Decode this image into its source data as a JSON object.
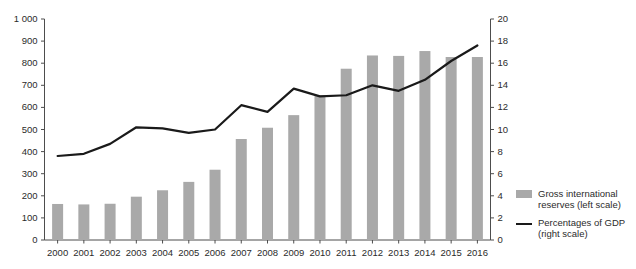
{
  "chart_data": {
    "type": "bar",
    "title": "",
    "subtitle": "",
    "xlabel": "",
    "ylabel": "",
    "grid": false,
    "legend_position": "right",
    "categories": [
      "2000",
      "2001",
      "2002",
      "2003",
      "2004",
      "2005",
      "2006",
      "2007",
      "2008",
      "2009",
      "2010",
      "2011",
      "2012",
      "2013",
      "2014",
      "2015",
      "2016"
    ],
    "axes": {
      "left": {
        "label": "",
        "min": 0,
        "max": 1000,
        "step": 100,
        "ticks": [
          "0",
          "100",
          "200",
          "300",
          "400",
          "500",
          "600",
          "700",
          "800",
          "900",
          "1 000"
        ],
        "tick_values": [
          0,
          100,
          200,
          300,
          400,
          500,
          600,
          700,
          800,
          900,
          1000
        ]
      },
      "right": {
        "label": "",
        "min": 0,
        "max": 20,
        "step": 2,
        "ticks": [
          "0",
          "2",
          "4",
          "6",
          "8",
          "10",
          "12",
          "14",
          "16",
          "18",
          "20"
        ],
        "tick_values": [
          0,
          2,
          4,
          6,
          8,
          10,
          12,
          14,
          16,
          18,
          20
        ]
      }
    },
    "series": [
      {
        "name": "Gross international reserves (left scale)",
        "type": "bar",
        "axis": "left",
        "color": "#a9a9a9",
        "values": [
          163,
          161,
          164,
          196,
          225,
          263,
          318,
          457,
          508,
          565,
          655,
          775,
          835,
          833,
          855,
          828,
          828
        ]
      },
      {
        "name": "Percentages of GDP (right scale)",
        "type": "line",
        "axis": "right",
        "color": "#1a1a1a",
        "values": [
          7.6,
          7.8,
          8.7,
          10.2,
          10.1,
          9.7,
          10.0,
          12.2,
          11.6,
          13.7,
          13.0,
          13.1,
          14.0,
          13.5,
          14.5,
          16.2,
          17.6
        ]
      }
    ]
  },
  "legend": {
    "items": [
      {
        "marker": "bar-swatch",
        "line1": "Gross international",
        "line2": "reserves (left scale)"
      },
      {
        "marker": "line-swatch",
        "line1": "Percentages of GDP",
        "line2": "(right scale)"
      }
    ]
  },
  "colors": {
    "bar": "#a9a9a9",
    "line": "#1a1a1a",
    "axis": "#4d4d4d",
    "text": "#2b2b2b",
    "background": "#ffffff"
  }
}
